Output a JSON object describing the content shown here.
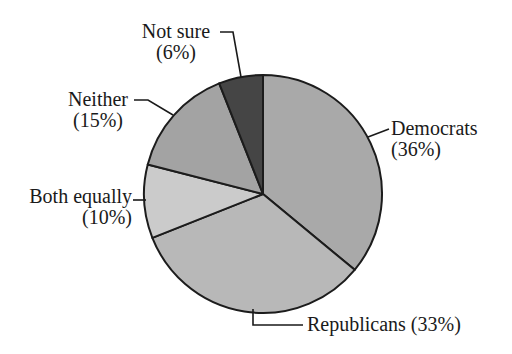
{
  "page": {
    "background": "#ffffff",
    "text_color": "#1a1a1a"
  },
  "chart_data": {
    "type": "pie",
    "title": "",
    "categories": [
      "Democrats",
      "Republicans",
      "Both equally",
      "Neither",
      "Not sure"
    ],
    "values": [
      36,
      33,
      10,
      15,
      6
    ],
    "percent_labels": [
      "(36%)",
      "(33%)",
      "(10%)",
      "(15%)",
      "(6%)"
    ],
    "slice_colors": [
      "#a9a9a9",
      "#b8b8b8",
      "#cbcbcb",
      "#a3a3a3",
      "#454545"
    ],
    "outline_color": "#1c1c1c",
    "outline_width": 2,
    "start_angle_deg": 0,
    "direction": "clockwise",
    "center": {
      "x": 263,
      "y": 194
    },
    "radius": 119,
    "legend_position": "callout-labels",
    "grid": false
  },
  "labels": {
    "not_sure": {
      "line1": "Not sure",
      "line2": "(6%)"
    },
    "neither": {
      "line1": "Neither",
      "line2": "(15%)"
    },
    "both_equally": {
      "line1": "Both equally",
      "line2": "(10%)"
    },
    "democrats": {
      "line1": "Democrats",
      "line2": "(36%)"
    },
    "republicans": {
      "line1": "Republicans (33%)"
    }
  },
  "leader_line_color": "#1a1a1a"
}
